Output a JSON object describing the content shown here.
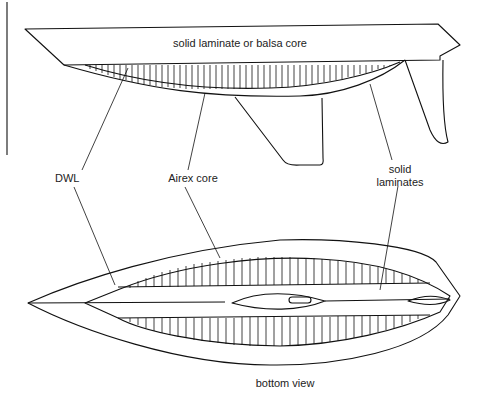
{
  "figure": {
    "side_view_label": "solid laminate or balsa core",
    "callouts": {
      "dwl": "DWL",
      "airex": "Airex core",
      "solid_line1": "solid",
      "solid_line2": "laminates"
    },
    "bottom_view_label": "bottom view"
  },
  "colors": {
    "line": "#111111",
    "background": "#ffffff"
  }
}
